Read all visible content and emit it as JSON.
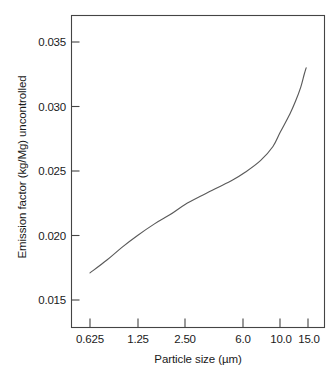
{
  "chart_data": {
    "type": "line",
    "title": "",
    "xlabel": "Particle size (µm)",
    "ylabel": "Emission factor (kg/Mg) uncontrolled",
    "xscale": "log",
    "yscale": "linear",
    "grid": false,
    "legend": "none",
    "xticks": [
      "0.625",
      "1.25",
      "2.50",
      "6.0",
      "10.0",
      "15.0"
    ],
    "xtick_values": [
      0.625,
      1.25,
      2.5,
      6.0,
      10.0,
      15.0
    ],
    "yticks": [
      "0.015",
      "0.020",
      "0.025",
      "0.030",
      "0.035"
    ],
    "ytick_values": [
      0.015,
      0.02,
      0.025,
      0.03,
      0.035
    ],
    "xlim": [
      0.625,
      15.0
    ],
    "ylim": [
      0.0128,
      0.0367
    ],
    "series": [
      {
        "name": "uncontrolled emission factor",
        "x": [
          0.625,
          0.8,
          1.0,
          1.25,
          1.6,
          2.0,
          2.5,
          3.2,
          4.0,
          5.0,
          6.0,
          7.5,
          9.0,
          10.0,
          11.5,
          12.5,
          13.5,
          14.2,
          14.6
        ],
        "y": [
          0.0171,
          0.0181,
          0.0191,
          0.02,
          0.0209,
          0.0216,
          0.0224,
          0.0231,
          0.0237,
          0.0243,
          0.0249,
          0.0258,
          0.0269,
          0.028,
          0.0294,
          0.0304,
          0.0315,
          0.0325,
          0.033
        ]
      }
    ]
  },
  "axes": {
    "x_title": "Particle size (µm)",
    "y_title": "Emission factor (kg/Mg) uncontrolled"
  }
}
